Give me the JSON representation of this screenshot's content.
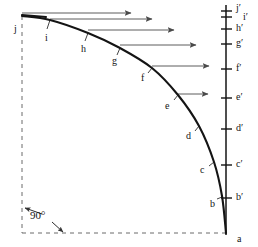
{
  "figure": {
    "colors": {
      "curve": "#141414",
      "axis": "#141414",
      "arrow": "#4a4a4a",
      "dashed": "#6b6b6b",
      "background": "#ffffff",
      "text": "#141414"
    }
  },
  "curve_labels": [
    {
      "id": "j",
      "text": "j",
      "x": 14,
      "y": 24
    },
    {
      "id": "i",
      "text": "i",
      "x": 45,
      "y": 33
    },
    {
      "id": "h",
      "text": "h",
      "x": 81,
      "y": 44
    },
    {
      "id": "g",
      "text": "g",
      "x": 112,
      "y": 56
    },
    {
      "id": "f",
      "text": "f",
      "x": 141,
      "y": 73
    },
    {
      "id": "e",
      "text": "e",
      "x": 165,
      "y": 101
    },
    {
      "id": "d",
      "text": "d",
      "x": 186,
      "y": 131
    },
    {
      "id": "c",
      "text": "c",
      "x": 200,
      "y": 165
    },
    {
      "id": "b",
      "text": "b",
      "x": 210,
      "y": 199
    },
    {
      "id": "a",
      "text": "a",
      "x": 237,
      "y": 234
    }
  ],
  "axis_labels": [
    {
      "id": "j-prime",
      "text": "j′",
      "x": 236,
      "y": 6
    },
    {
      "id": "i-prime",
      "text": "i′",
      "x": 243,
      "y": 14
    },
    {
      "id": "h-prime",
      "text": "h′",
      "x": 236,
      "y": 25
    },
    {
      "id": "g-prime",
      "text": "g′",
      "x": 236,
      "y": 40
    },
    {
      "id": "f-prime",
      "text": "f′",
      "x": 236,
      "y": 65
    },
    {
      "id": "e-prime",
      "text": "e′",
      "x": 236,
      "y": 94
    },
    {
      "id": "d-prime",
      "text": "d′",
      "x": 236,
      "y": 126
    },
    {
      "id": "c-prime",
      "text": "c′",
      "x": 236,
      "y": 162
    },
    {
      "id": "b-prime",
      "text": "b′",
      "x": 236,
      "y": 196
    }
  ],
  "annotation": {
    "angle_label": "90°",
    "angle_label_x": 30,
    "angle_label_y": 214
  },
  "chart_data": {
    "type": "line",
    "xlabel": "",
    "ylabel": "",
    "grid": false,
    "legend": "none",
    "curve_points": [
      {
        "label": "j",
        "x": 22,
        "y": 16
      },
      {
        "label": "i",
        "x": 50,
        "y": 20
      },
      {
        "label": "h",
        "x": 88,
        "y": 33
      },
      {
        "label": "g",
        "x": 120,
        "y": 48
      },
      {
        "label": "f",
        "x": 152,
        "y": 68
      },
      {
        "label": "e",
        "x": 178,
        "y": 95
      },
      {
        "label": "d",
        "x": 199,
        "y": 126
      },
      {
        "label": "c",
        "x": 214,
        "y": 162
      },
      {
        "label": "b",
        "x": 222,
        "y": 196
      },
      {
        "label": "a",
        "x": 226,
        "y": 233
      }
    ],
    "axis_ticks": [
      {
        "label": "j′",
        "y": 11
      },
      {
        "label": "i′",
        "y": 17
      },
      {
        "label": "h′",
        "y": 29
      },
      {
        "label": "g′",
        "y": 44
      },
      {
        "label": "f′",
        "y": 69
      },
      {
        "label": "e′",
        "y": 98
      },
      {
        "label": "d′",
        "y": 129
      },
      {
        "label": "c′",
        "y": 165
      },
      {
        "label": "b′",
        "y": 198
      },
      {
        "label": "a",
        "y": 233
      }
    ],
    "arrows": [
      {
        "from_label": "j",
        "x1": 22,
        "y1": 13,
        "x2": 131,
        "y2": 13
      },
      {
        "from_label": "i",
        "x1": 50,
        "y1": 19,
        "x2": 152,
        "y2": 19
      },
      {
        "from_label": "h",
        "x1": 88,
        "y1": 30,
        "x2": 174,
        "y2": 30
      },
      {
        "from_label": "g",
        "x1": 120,
        "y1": 45,
        "x2": 196,
        "y2": 45
      },
      {
        "from_label": "f",
        "x1": 152,
        "y1": 66,
        "x2": 209,
        "y2": 66
      },
      {
        "from_label": "e",
        "x1": 178,
        "y1": 94,
        "x2": 208,
        "y2": 94
      }
    ],
    "dashed_reference": {
      "vertical_x": 22,
      "vertical_y1": 16,
      "vertical_y2": 233,
      "horizontal_y": 233,
      "horizontal_x1": 22,
      "horizontal_x2": 226
    }
  }
}
